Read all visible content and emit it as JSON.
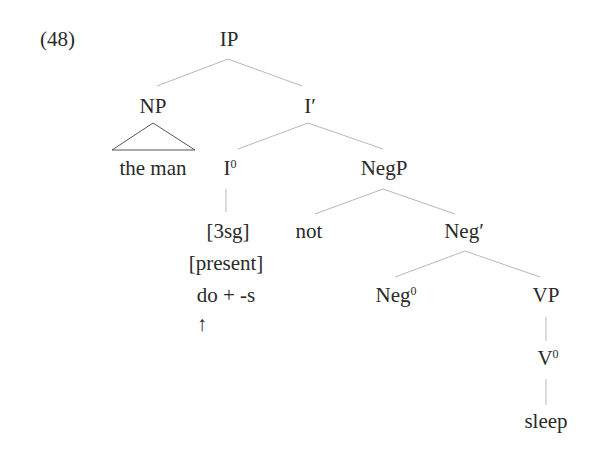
{
  "example_number": "(48)",
  "tree": {
    "IP": "IP",
    "NP": "NP",
    "I_bar": "I′",
    "the_man": "the man",
    "I0_base": "I",
    "I0_sup": "0",
    "NegP": "NegP",
    "feat_3sg": "[3sg]",
    "not": "not",
    "Neg_bar": "Neg′",
    "feat_present": "[present]",
    "do_s": "do + -s",
    "arrow": "↑",
    "Neg0_base": "Neg",
    "Neg0_sup": "0",
    "VP": "VP",
    "V0_base": "V",
    "V0_sup": "0",
    "sleep": "sleep"
  },
  "colors": {
    "text": "#2a2a2a",
    "edge": "#b8b8b8",
    "triangle": "#555555"
  }
}
